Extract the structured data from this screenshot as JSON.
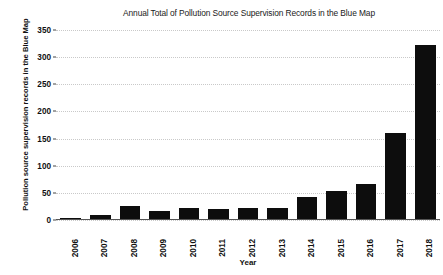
{
  "chart_data": {
    "type": "bar",
    "title": "Annual Total of Pollution Source Supervision Records in the Blue Map",
    "xlabel": "Year",
    "ylabel": "Pollution source supervision records in the Blue Map",
    "categories": [
      "2006",
      "2007",
      "2008",
      "2009",
      "2010",
      "2011",
      "2012",
      "2013",
      "2014",
      "2015",
      "2016",
      "2017",
      "2018"
    ],
    "values": [
      3,
      10,
      25,
      16,
      23,
      20,
      22,
      22,
      42,
      53,
      67,
      160,
      322
    ],
    "ylim": [
      0,
      350
    ],
    "yticks": [
      0,
      50,
      100,
      150,
      200,
      250,
      300,
      350
    ],
    "ytick_labels": [
      "0",
      "50",
      "100",
      "150",
      "200",
      "250",
      "300",
      "350"
    ],
    "grid": true,
    "grid_axis": "y",
    "legend": false,
    "bar_color": "#0d0d0d",
    "grid_color": "#c9c9c9",
    "background_color": "#ffffff",
    "series": [
      {
        "name": "Pollution source supervision records",
        "values": [
          3,
          10,
          25,
          16,
          23,
          20,
          22,
          22,
          42,
          53,
          67,
          160,
          322
        ]
      }
    ]
  }
}
